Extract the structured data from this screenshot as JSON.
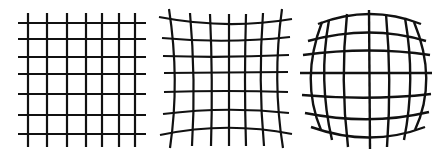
{
  "diagram": {
    "panels": [
      {
        "id": "none",
        "label": "No distortion",
        "rows": 7,
        "cols": 7
      },
      {
        "id": "pincushion",
        "label": "Pincushion distortion",
        "rows": 7,
        "cols": 7
      },
      {
        "id": "barrel",
        "label": "Barrel distortion",
        "rows": 7,
        "cols": 7
      }
    ],
    "colors": {
      "line": "#111111",
      "background": "#ffffff"
    },
    "stroke_width": 2.2
  }
}
